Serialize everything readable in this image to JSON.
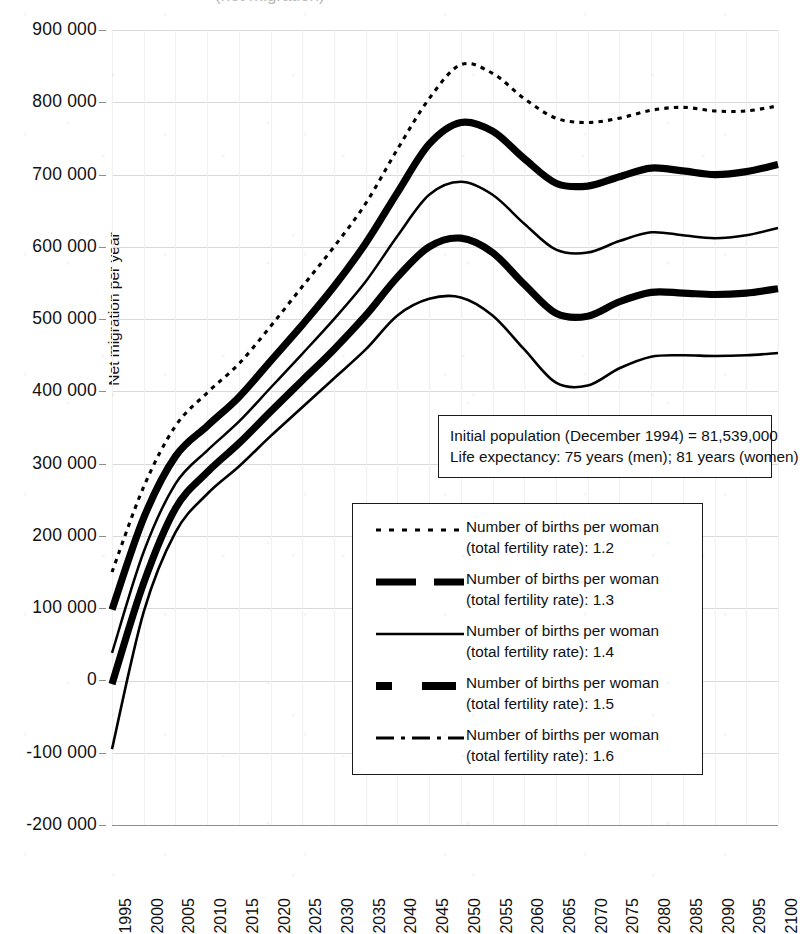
{
  "figure": {
    "cropped_title_fragment": "(net migration)",
    "background_color": "#ffffff",
    "ink_color": "#000000",
    "gridline_color": "#d9d9d9"
  },
  "annotation": {
    "line1": "Initial population (December 1994) = 81,539,000",
    "line2": "Life expectancy: 75 years (men); 81 years (women)"
  },
  "legend": {
    "entries": [
      {
        "style": "fine-dotted",
        "line1": "Number of births per woman",
        "line2": "(total fertility rate): 1.2",
        "tfr": "1.2"
      },
      {
        "style": "thick-dashed",
        "line1": "Number of births per woman",
        "line2": "(total fertility rate): 1.3",
        "tfr": "1.3"
      },
      {
        "style": "thin-solid",
        "line1": "Number of births per woman",
        "line2": "(total fertility rate): 1.4",
        "tfr": "1.4"
      },
      {
        "style": "thick-dash-gap",
        "line1": "Number of births per woman",
        "line2": "(total fertility rate): 1.5",
        "tfr": "1.5"
      },
      {
        "style": "dash-dot",
        "line1": "Number of births per woman",
        "line2": "(total fertility rate): 1.6",
        "tfr": "1.6"
      }
    ]
  },
  "chart_data": {
    "type": "line",
    "title": "",
    "xlabel": "",
    "ylabel": "Net migration per year",
    "xlim": [
      1995,
      2100
    ],
    "ylim": [
      -200000,
      900000
    ],
    "ytick_step": 100000,
    "grid": true,
    "legend_position": "inside-center-right",
    "ytick_labels": [
      "900 000",
      "800 000",
      "700 000",
      "600 000",
      "500 000",
      "400 000",
      "300 000",
      "200 000",
      "100 000",
      "0",
      "-100 000",
      "-200 000"
    ],
    "ytick_values": [
      900000,
      800000,
      700000,
      600000,
      500000,
      400000,
      300000,
      200000,
      100000,
      0,
      -100000,
      -200000
    ],
    "xtick_labels": [
      "1995",
      "2000",
      "2005",
      "2010",
      "2015",
      "2020",
      "2025",
      "2030",
      "2035",
      "2040",
      "2045",
      "2050",
      "2055",
      "2060",
      "2065",
      "2070",
      "2075",
      "2080",
      "2085",
      "2090",
      "2095",
      "2100"
    ],
    "x": [
      1995,
      2000,
      2005,
      2010,
      2015,
      2020,
      2025,
      2030,
      2035,
      2040,
      2045,
      2050,
      2055,
      2060,
      2065,
      2070,
      2075,
      2080,
      2085,
      2090,
      2095,
      2100
    ],
    "series": [
      {
        "name": "Number of births per woman (total fertility rate): 1.2",
        "tfr": 1.2,
        "style": "fine-dotted",
        "values": [
          150000,
          268000,
          352000,
          398000,
          438000,
          490000,
          545000,
          600000,
          660000,
          735000,
          805000,
          852000,
          840000,
          805000,
          778000,
          772000,
          778000,
          789000,
          793000,
          788000,
          788000,
          795000
        ]
      },
      {
        "name": "Number of births per woman (total fertility rate): 1.3",
        "tfr": 1.3,
        "style": "thick-dashed",
        "values": [
          98000,
          225000,
          310000,
          352000,
          392000,
          442000,
          492000,
          545000,
          605000,
          675000,
          742000,
          772000,
          760000,
          722000,
          688000,
          684000,
          697000,
          709000,
          705000,
          700000,
          704000,
          714000
        ]
      },
      {
        "name": "Number of births per woman (total fertility rate): 1.4",
        "tfr": 1.4,
        "style": "thin-solid",
        "values": [
          38000,
          178000,
          272000,
          318000,
          358000,
          405000,
          452000,
          500000,
          552000,
          615000,
          672000,
          690000,
          672000,
          632000,
          596000,
          592000,
          608000,
          620000,
          616000,
          612000,
          616000,
          626000
        ]
      },
      {
        "name": "Number of births per woman (total fertility rate): 1.5",
        "tfr": 1.5,
        "style": "thick-dash-gap",
        "values": [
          -5000,
          135000,
          238000,
          288000,
          328000,
          372000,
          415000,
          458000,
          505000,
          558000,
          600000,
          612000,
          592000,
          548000,
          508000,
          504000,
          524000,
          537000,
          536000,
          534000,
          536000,
          542000
        ]
      },
      {
        "name": "Number of births per woman (total fertility rate): 1.6",
        "tfr": 1.6,
        "style": "dash-dot",
        "values": [
          -95000,
          95000,
          205000,
          258000,
          296000,
          338000,
          378000,
          418000,
          458000,
          505000,
          528000,
          530000,
          505000,
          458000,
          412000,
          408000,
          432000,
          448000,
          450000,
          449000,
          450000,
          453000
        ]
      }
    ]
  }
}
